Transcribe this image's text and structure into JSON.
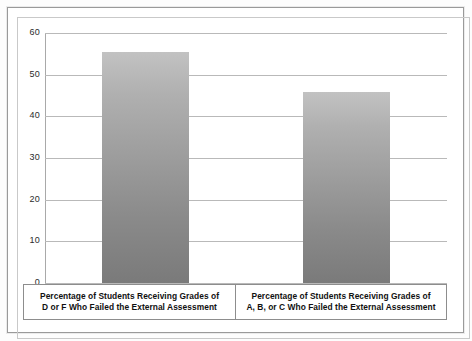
{
  "chart_data": {
    "type": "bar",
    "title": "",
    "subtitle": "",
    "xlabel": "",
    "ylabel": "",
    "ylim": [
      0,
      60
    ],
    "ytick_step": 10,
    "yticks": [
      "0",
      "10",
      "20",
      "30",
      "40",
      "50",
      "60"
    ],
    "grid": true,
    "legend": "none",
    "categories": [
      "Percentage of Students Receiving Grades of D or F Who Failed the External Assessment",
      "Percentage of Students Receiving Grades of A, B, or C Who Failed the External Assessment"
    ],
    "category_lines": [
      [
        "Percentage of Students Receiving Grades of",
        "D or F Who Failed the External Assessment"
      ],
      [
        "Percentage of Students Receiving Grades of",
        "A, B, or C Who Failed the External Assessment"
      ]
    ],
    "values": [
      55.5,
      45.8
    ],
    "bar_color_top": "#c2c2c2",
    "bar_color_bottom": "#7a7a7a",
    "gridline_color": "#b9b9b9",
    "axis_color": "#a9a9a9",
    "frame_color": "#9a9a9a"
  }
}
